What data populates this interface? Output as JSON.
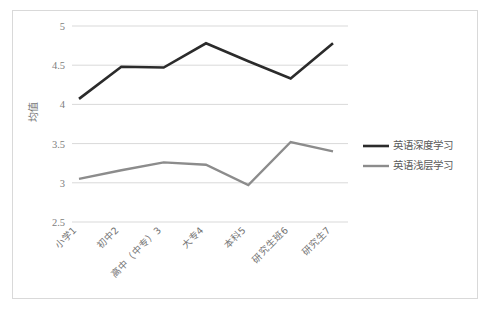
{
  "chart_data": {
    "type": "line",
    "title": "",
    "xlabel": "",
    "ylabel": "均值",
    "ylim": [
      2.5,
      5
    ],
    "yticks": [
      "2.5",
      "3",
      "3.5",
      "4",
      "4.5",
      "5"
    ],
    "ytick_values": [
      2.5,
      3,
      3.5,
      4,
      4.5,
      5
    ],
    "grid": true,
    "legend_position": "right",
    "categories": [
      "小学1",
      "初中2",
      "高中（中专）3",
      "大专4",
      "本科5",
      "研究生班6",
      "研究生7"
    ],
    "series": [
      {
        "name": "英语深度学习",
        "color": "#2b2b2b",
        "width": 2.6,
        "values": [
          4.07,
          4.48,
          4.47,
          4.78,
          4.55,
          4.33,
          4.78
        ]
      },
      {
        "name": "英语浅层学习",
        "color": "#8c8c8c",
        "width": 2.4,
        "values": [
          3.05,
          3.16,
          3.26,
          3.23,
          2.97,
          3.52,
          3.4
        ]
      }
    ]
  },
  "frame": {
    "border_color": "#d9d9d9",
    "background": "#ffffff"
  },
  "legend": {
    "items": [
      {
        "label": "英语深度学习",
        "color": "#2b2b2b"
      },
      {
        "label": "英语浅层学习",
        "color": "#8c8c8c"
      }
    ]
  }
}
